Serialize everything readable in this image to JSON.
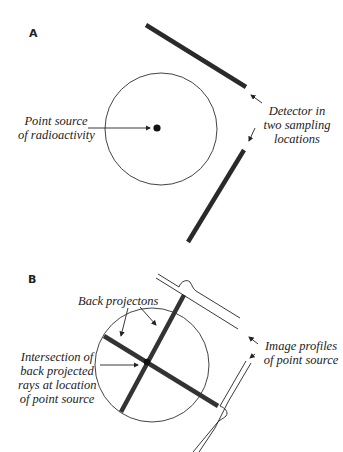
{
  "figure": {
    "caption_cutoff": "",
    "panels": [
      {
        "label": "A",
        "annotations": {
          "point_source": [
            "Point source",
            "of radioactivity"
          ],
          "detector": [
            "Detector in",
            "two sampling",
            "locations"
          ]
        }
      },
      {
        "label": "B",
        "annotations": {
          "back_projections": "Back projectons",
          "intersection": [
            "Intersection of",
            "back projected",
            "rays at location",
            "of point source"
          ],
          "image_profiles": [
            "Image profiles",
            "of point source"
          ]
        }
      }
    ],
    "colors": {
      "ink": "#222222",
      "detector": "#333333",
      "circle": "#444444",
      "background": "#ffffff"
    }
  }
}
